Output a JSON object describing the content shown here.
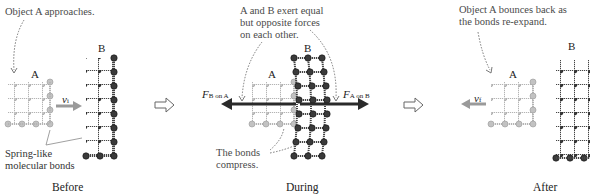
{
  "panels": [
    {
      "caption": "Before",
      "annotation": "Object A approaches.",
      "object_a_label": "A",
      "object_b_label": "B",
      "velocity_label": "v",
      "velocity_subscript": "i",
      "bonds_note_line1": "Spring-like",
      "bonds_note_line2": "molecular bonds"
    },
    {
      "caption": "During",
      "annotation_line1": "A and B exert equal",
      "annotation_line2": "but opposite forces",
      "annotation_line3": "on each other.",
      "object_a_label": "A",
      "object_b_label": "B",
      "force_left_label": "F",
      "force_left_subscript": "B on A",
      "force_right_label": "F",
      "force_right_subscript": "A on B",
      "compress_note_line1": "The bonds",
      "compress_note_line2": "compress."
    },
    {
      "caption": "After",
      "annotation_line1": "Object A bounces back as",
      "annotation_line2": "the bonds re-expand.",
      "object_a_label": "A",
      "object_b_label": "B",
      "velocity_label": "v",
      "velocity_subscript": "f"
    }
  ],
  "colors": {
    "object_a": "#b8b8b8",
    "object_b": "#3a3a3a",
    "force_arrow": "#2a2a2a",
    "velocity_arrow": "#9a9a9a",
    "annotation_text": "#4a4a4a"
  }
}
